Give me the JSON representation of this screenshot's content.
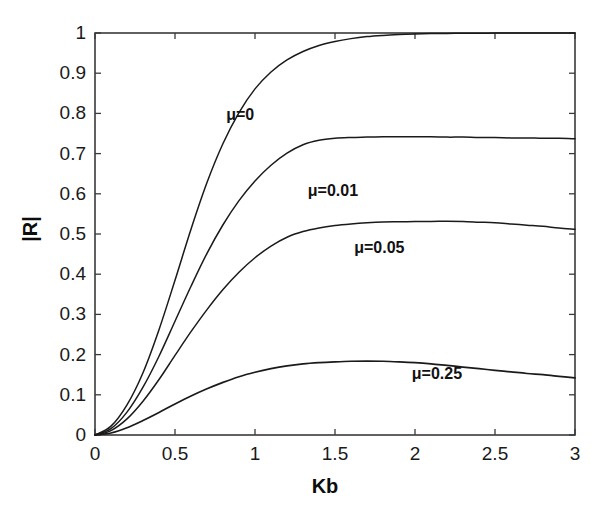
{
  "figure": {
    "background_color": "#ffffff",
    "axis_color": "#3a3a3a",
    "curve_color": "#1a1a1a"
  },
  "chart_data": {
    "type": "line",
    "title": "",
    "xlabel": "Kb",
    "ylabel": "|R|",
    "xlim": [
      0,
      3
    ],
    "ylim": [
      0,
      1
    ],
    "grid": false,
    "legend_position": "inline-annotations",
    "xticks": [
      0,
      0.5,
      1,
      1.5,
      2,
      2.5,
      3
    ],
    "xtick_labels": [
      "0",
      "0.5",
      "1",
      "1.5",
      "2",
      "2.5",
      "3"
    ],
    "yticks": [
      0,
      0.1,
      0.2,
      0.3,
      0.4,
      0.5,
      0.6,
      0.7,
      0.8,
      0.9,
      1
    ],
    "ytick_labels": [
      "0",
      "0.1",
      "0.2",
      "0.3",
      "0.4",
      "0.5",
      "0.6",
      "0.7",
      "0.8",
      "0.9",
      "1"
    ],
    "x": [
      0,
      0.1,
      0.2,
      0.3,
      0.4,
      0.5,
      0.6,
      0.7,
      0.8,
      0.9,
      1.0,
      1.1,
      1.2,
      1.3,
      1.4,
      1.5,
      1.6,
      1.7,
      1.8,
      1.9,
      2.0,
      2.1,
      2.2,
      2.3,
      2.4,
      2.5,
      2.6,
      2.7,
      2.8,
      2.9,
      3.0
    ],
    "series": [
      {
        "name": "mu=0",
        "label": "μ=0",
        "label_x": 0.82,
        "label_y": 0.795,
        "values": [
          0.0,
          0.022,
          0.075,
          0.155,
          0.262,
          0.385,
          0.512,
          0.628,
          0.725,
          0.802,
          0.861,
          0.903,
          0.933,
          0.954,
          0.969,
          0.979,
          0.986,
          0.991,
          0.994,
          0.996,
          0.9975,
          0.9985,
          0.999,
          0.9993,
          0.9995,
          0.9997,
          0.9998,
          0.9999,
          0.9999,
          1.0,
          1.0
        ]
      },
      {
        "name": "mu=0.01",
        "label": "μ=0.01",
        "label_x": 1.33,
        "label_y": 0.608,
        "values": [
          0.0,
          0.016,
          0.057,
          0.119,
          0.196,
          0.283,
          0.37,
          0.452,
          0.523,
          0.583,
          0.632,
          0.671,
          0.701,
          0.722,
          0.733,
          0.738,
          0.74,
          0.741,
          0.742,
          0.742,
          0.742,
          0.742,
          0.741,
          0.741,
          0.74,
          0.74,
          0.739,
          0.739,
          0.738,
          0.738,
          0.737
        ]
      },
      {
        "name": "mu=0.05",
        "label": "μ=0.05",
        "label_x": 1.62,
        "label_y": 0.465,
        "values": [
          0.0,
          0.011,
          0.04,
          0.084,
          0.138,
          0.198,
          0.257,
          0.312,
          0.362,
          0.405,
          0.441,
          0.47,
          0.492,
          0.506,
          0.515,
          0.521,
          0.525,
          0.528,
          0.53,
          0.5305,
          0.531,
          0.5313,
          0.5315,
          0.531,
          0.5295,
          0.528,
          0.525,
          0.522,
          0.519,
          0.515,
          0.512
        ]
      },
      {
        "name": "mu=0.25",
        "label": "μ=0.25",
        "label_x": 1.98,
        "label_y": 0.152,
        "values": [
          0.0,
          0.005,
          0.018,
          0.036,
          0.056,
          0.077,
          0.097,
          0.115,
          0.131,
          0.145,
          0.156,
          0.165,
          0.172,
          0.177,
          0.18,
          0.182,
          0.1835,
          0.184,
          0.1835,
          0.182,
          0.18,
          0.177,
          0.173,
          0.169,
          0.165,
          0.161,
          0.157,
          0.153,
          0.15,
          0.146,
          0.142
        ]
      }
    ]
  }
}
